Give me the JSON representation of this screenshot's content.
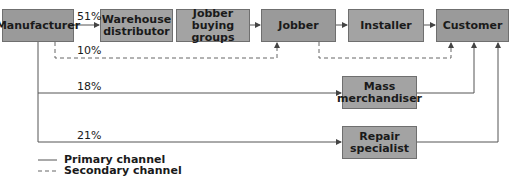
{
  "nodes": {
    "manufacturer": "Manufacturer",
    "warehouse": "Warehouse distributor",
    "buying_groups": "Jobber buying groups",
    "jobber": "Jobber",
    "installer": "Installer",
    "customer": "Customer",
    "mass": "Mass merchandiser",
    "repair": "Repair specialist"
  },
  "percentages": {
    "warehouse": "51%",
    "secondary_jobber": "10%",
    "mass": "18%",
    "repair": "21%"
  },
  "legend": {
    "primary": "Primary channel",
    "secondary": "Secondary channel"
  },
  "colors": {
    "box": "#a3a3a3",
    "line": "#555555"
  }
}
